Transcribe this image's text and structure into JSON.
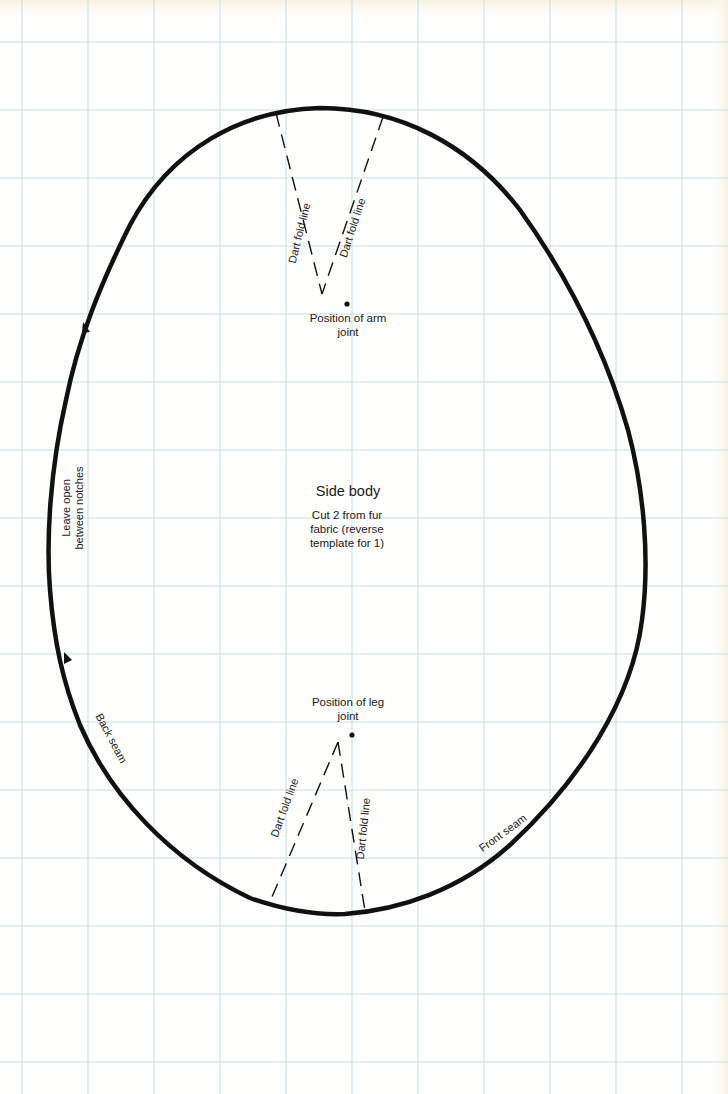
{
  "pattern": {
    "title": "Side body",
    "instructions": [
      "Cut 2 from fur",
      "fabric (reverse",
      "template for 1)"
    ],
    "arm_joint": [
      "Position of arm",
      "joint"
    ],
    "leg_joint": [
      "Position of leg",
      "joint"
    ],
    "dart_label": "Dart fold line",
    "leave_open": [
      "Leave open",
      "between notches"
    ],
    "back_seam": "Back seam",
    "front_seam": "Front seam"
  },
  "colors": {
    "paper": "#fefefc",
    "grid": "#c9dfe9",
    "ink": "#111111"
  },
  "grid": {
    "x": [
      22,
      88,
      154,
      220,
      286,
      352,
      418,
      484,
      550,
      616,
      682
    ],
    "y": [
      42,
      110,
      178,
      246,
      314,
      382,
      450,
      518,
      586,
      654,
      722,
      790,
      858,
      926,
      994,
      1062
    ]
  }
}
